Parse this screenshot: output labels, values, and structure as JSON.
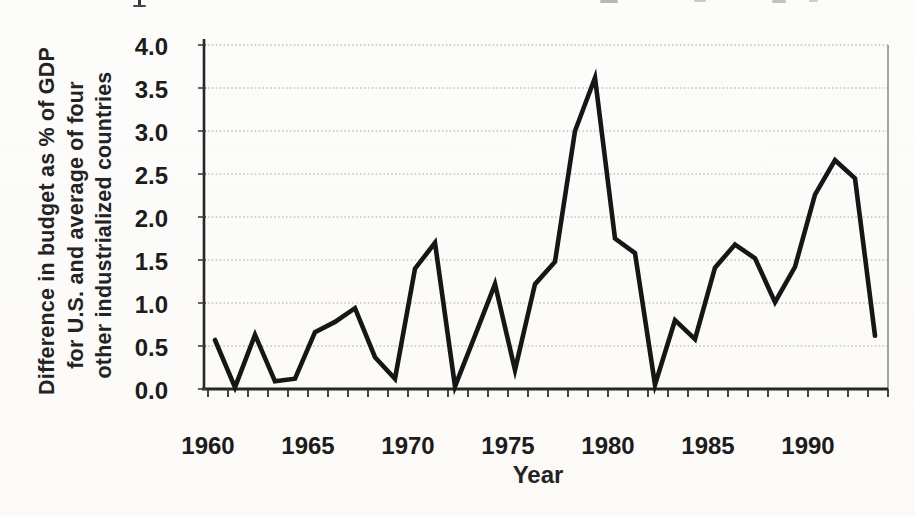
{
  "figure": {
    "kind": "scanned textbook line chart",
    "x_axis_title": "Year",
    "y_axis_title_lines": [
      "Difference in budget as % of GDP",
      "for U.S. and average of four",
      "other industrialized countries"
    ]
  },
  "chart_data": {
    "type": "line",
    "title": "",
    "xlabel": "Year",
    "ylabel": "Difference in budget as % of GDP for U.S. and average of four other industrialized countries",
    "x": [
      1960,
      1961,
      1962,
      1963,
      1964,
      1965,
      1966,
      1967,
      1968,
      1969,
      1970,
      1971,
      1972,
      1973,
      1974,
      1975,
      1976,
      1977,
      1978,
      1979,
      1980,
      1981,
      1982,
      1983,
      1984,
      1985,
      1986,
      1987,
      1988,
      1989,
      1990,
      1991,
      1992,
      1993
    ],
    "values": [
      0.57,
      0.02,
      0.63,
      0.09,
      0.12,
      0.66,
      0.78,
      0.94,
      0.37,
      0.12,
      1.4,
      1.7,
      0.03,
      0.62,
      1.22,
      0.22,
      1.22,
      1.48,
      3.0,
      3.62,
      1.75,
      1.58,
      0.05,
      0.8,
      0.58,
      1.41,
      1.68,
      1.52,
      1.01,
      1.42,
      2.26,
      2.66,
      2.45,
      0.62
    ],
    "xlim": [
      1960,
      1994
    ],
    "ylim": [
      0.0,
      4.0
    ],
    "ytick_labels": [
      "4.0",
      "3.5",
      "3.0",
      "2.5",
      "2.0",
      "1.5",
      "1.0",
      "0.5",
      "0.0"
    ],
    "xtick_labels": [
      "1960",
      "1965",
      "1970",
      "1975",
      "1980",
      "1985",
      "1990"
    ],
    "xtick_label_years": [
      1960,
      1965,
      1970,
      1975,
      1980,
      1985,
      1990
    ],
    "minor_xticks_every_years": 1,
    "grid": "horizontal dotted gridlines at 0.5 intervals",
    "legend": "none",
    "line_color": "#161616",
    "gridline_color": "#a8a8a8",
    "axis_color": "#262626"
  }
}
